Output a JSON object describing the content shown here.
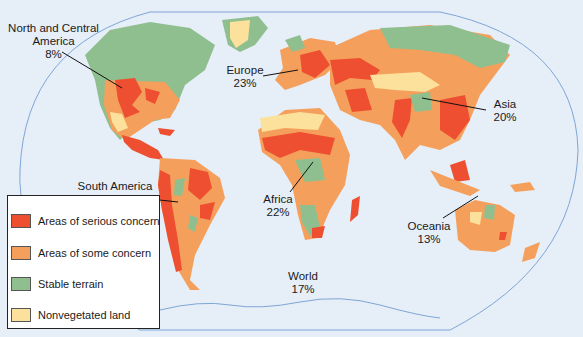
{
  "colors": {
    "ocean": "#e6eef8",
    "serious_concern": "#ee4f30",
    "some_concern": "#f4a05c",
    "stable_terrain": "#8fbf8f",
    "nonvegetated": "#fbe19b",
    "outline": "#7fa6d6"
  },
  "regions": [
    {
      "name": "North and Central America",
      "line1": "North and Central",
      "line2": "America",
      "value": "8%"
    },
    {
      "name": "Europe",
      "line1": "Europe",
      "value": "23%"
    },
    {
      "name": "Asia",
      "line1": "Asia",
      "value": "20%"
    },
    {
      "name": "South America",
      "line1": "South America",
      "value": "14%"
    },
    {
      "name": "Africa",
      "line1": "Africa",
      "value": "22%"
    },
    {
      "name": "Oceania",
      "line1": "Oceania",
      "value": "13%"
    },
    {
      "name": "World",
      "line1": "World",
      "value": "17%"
    }
  ],
  "legend": {
    "items": [
      {
        "label": "Areas of serious concern",
        "color": "#ee4f30"
      },
      {
        "label": "Areas of some concern",
        "color": "#f4a05c"
      },
      {
        "label": "Stable terrain",
        "color": "#8fbf8f"
      },
      {
        "label": "Nonvegetated land",
        "color": "#fbe19b"
      }
    ]
  }
}
